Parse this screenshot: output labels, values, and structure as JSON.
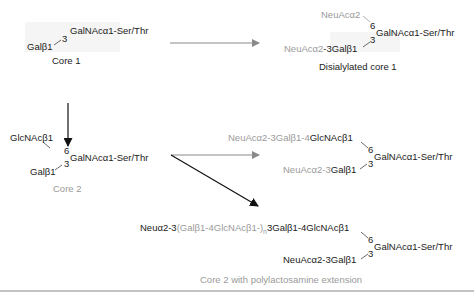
{
  "core1": {
    "galnac": "GalNAcα1-Ser/Thr",
    "gal": "Galβ1",
    "pos3": "3",
    "caption": "Core 1"
  },
  "disialylated_core1": {
    "neuac_top": "NeuAcα2",
    "pos6": "6",
    "galnac": "GalNAcα1-Ser/Thr",
    "pos3": "3",
    "neuac_bottom_prefix": "NeuAcα2",
    "neuac_bottom_suffix": "-3Galβ1",
    "caption": "Disialylated core 1"
  },
  "core2": {
    "glcnac": "GlcNAcβ1",
    "pos6": "6",
    "galnac": "GalNAcα1-Ser/Thr",
    "pos3": "3",
    "gal": "Galβ1",
    "caption": "Core 2"
  },
  "sialylated_core2": {
    "top_prefix": "NeuAcα2-3Galβ1-4",
    "top_suffix": "GlcNAcβ1",
    "pos6": "6",
    "galnac": "GalNAcα1-Ser/Thr",
    "pos3": "3",
    "bottom_prefix": "NeuAcα2-3",
    "bottom_suffix": "Galβ1"
  },
  "polylactosamine_core2": {
    "top_a": "Neuα2-3",
    "top_b": "(Galβ1-4GlcNAcβ1-)",
    "top_sub": "n",
    "top_c": "3Galβ1-4GlcNAcβ1",
    "pos6": "6",
    "galnac": "GalNAcα1-Ser/Thr",
    "pos3": "3",
    "bottom": "NeuAcα2-3Galβ1",
    "caption": "Core 2 with polylactosamine extension"
  },
  "colors": {
    "dark_text": "#222222",
    "gray_text": "#9a9a9a",
    "gray_arrow": "#8a8a8a",
    "black_arrow": "#111111",
    "rule": "#888888"
  }
}
